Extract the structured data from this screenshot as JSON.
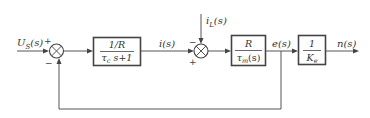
{
  "diagram": {
    "type": "control-system block diagram",
    "signals": {
      "input": {
        "main": "U",
        "sub": "S",
        "arg": "(s)"
      },
      "current": "i(s)",
      "disturbance": {
        "main": "i",
        "sub": "L",
        "arg": "(s)"
      },
      "error": "e(s)",
      "output": "n(s)"
    },
    "summing_junctions": [
      {
        "id": "sum1",
        "signs": {
          "top": "+",
          "bottom": "−"
        }
      },
      {
        "id": "sum2",
        "signs": {
          "top": "−",
          "bottom": "+"
        }
      }
    ],
    "blocks": [
      {
        "id": "block1",
        "numerator": "1/R",
        "denominator": {
          "main": "τ",
          "sub": "c",
          "rest": " s+1"
        }
      },
      {
        "id": "block2",
        "numerator": "R",
        "denominator": {
          "main": "τ",
          "sub": "m",
          "rest": "(s)"
        }
      },
      {
        "id": "block3",
        "numerator": "1",
        "denominator": {
          "main": "K",
          "sub": "e",
          "rest": ""
        }
      }
    ],
    "colors": {
      "line": "#555555",
      "text": "#333333",
      "background": "#ffffff"
    }
  }
}
